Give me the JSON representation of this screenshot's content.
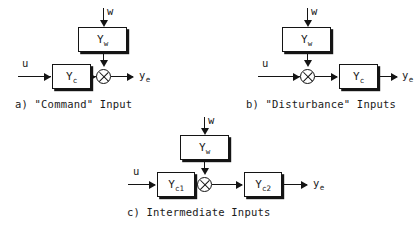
{
  "figure": {
    "background_color": "#ffffff",
    "line_color": "#141414"
  },
  "diagrams": [
    {
      "id": "a",
      "caption": "a) \"Command\" Input",
      "inputs": [
        {
          "name": "u",
          "label": "u"
        },
        {
          "name": "w",
          "label": "w"
        }
      ],
      "outputs": [
        {
          "name": "ye",
          "label": "y",
          "sub": "e"
        }
      ],
      "blocks": [
        {
          "name": "Yw",
          "label": "Y",
          "sub": "w"
        },
        {
          "name": "Yc",
          "label": "Y",
          "sub": "c"
        }
      ],
      "junction": {
        "name": "summing-junction",
        "symbol": "cross-circle"
      },
      "path": "u -> Yc -> sum -> ye ; w -> Yw -> sum"
    },
    {
      "id": "b",
      "caption": "b) \"Disturbance\" Inputs",
      "inputs": [
        {
          "name": "u",
          "label": "u"
        },
        {
          "name": "w",
          "label": "w"
        }
      ],
      "outputs": [
        {
          "name": "ye",
          "label": "y",
          "sub": "e"
        }
      ],
      "blocks": [
        {
          "name": "Yw",
          "label": "Y",
          "sub": "w"
        },
        {
          "name": "Yc",
          "label": "Y",
          "sub": "c"
        }
      ],
      "junction": {
        "name": "summing-junction",
        "symbol": "cross-circle"
      },
      "path": "u -> sum -> Yc -> ye ; w -> Yw -> sum"
    },
    {
      "id": "c",
      "caption": "c) Intermediate Inputs",
      "inputs": [
        {
          "name": "u",
          "label": "u"
        },
        {
          "name": "w",
          "label": "w"
        }
      ],
      "outputs": [
        {
          "name": "ye",
          "label": "y",
          "sub": "e"
        }
      ],
      "blocks": [
        {
          "name": "Yw",
          "label": "Y",
          "sub": "w"
        },
        {
          "name": "Yc1",
          "label": "Y",
          "sub": "c1"
        },
        {
          "name": "Yc2",
          "label": "Y",
          "sub": "c2"
        }
      ],
      "junction": {
        "name": "summing-junction",
        "symbol": "cross-circle"
      },
      "path": "u -> Yc1 -> sum -> Yc2 -> ye ; w -> Yw -> sum"
    }
  ]
}
